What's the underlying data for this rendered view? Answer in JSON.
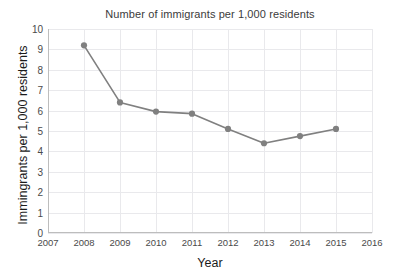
{
  "chart_data": {
    "type": "line",
    "title": "Number of immigrants per 1,000 residents",
    "xlabel": "Year",
    "ylabel": "Immingrants  per 1,000 residents",
    "x": [
      2008,
      2009,
      2010,
      2011,
      2012,
      2013,
      2014,
      2015
    ],
    "values": [
      9.2,
      6.4,
      5.95,
      5.85,
      5.1,
      4.4,
      4.75,
      5.1
    ],
    "series": [
      {
        "name": "Immigrants per 1,000 residents",
        "values": [
          9.2,
          6.4,
          5.95,
          5.85,
          5.1,
          4.4,
          4.75,
          5.1
        ]
      }
    ],
    "xlim": [
      2007,
      2016
    ],
    "ylim": [
      0,
      10
    ],
    "xticks": [
      "2007",
      "2008",
      "2009",
      "2010",
      "2011",
      "2012",
      "2013",
      "2014",
      "2015",
      "2016"
    ],
    "yticks": [
      "0",
      "1",
      "2",
      "3",
      "4",
      "5",
      "6",
      "7",
      "8",
      "9",
      "10"
    ],
    "grid": true,
    "legend": false,
    "legend_position": "none",
    "line_color": "#808080",
    "marker_color": "#808080",
    "grid_color": "#e9e9ec",
    "axis_color": "#bdbdbd",
    "background_color": "#ffffff"
  }
}
